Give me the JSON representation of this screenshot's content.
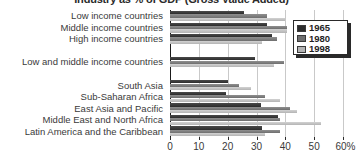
{
  "chart_data": {
    "type": "bar",
    "orientation": "horizontal",
    "title": "Industry as % of GDP (Gross Value Added)",
    "xlabel": "",
    "ylabel": "",
    "xlim": [
      0,
      60
    ],
    "xticks": [
      0,
      10,
      20,
      30,
      40,
      50,
      60
    ],
    "xtick_labels": [
      "0",
      "10",
      "20",
      "30",
      "40",
      "50",
      "60%"
    ],
    "grid": true,
    "grid_axis": "x",
    "legend_position": "upper right",
    "categories": [
      "Low income countries",
      "Middle income countries",
      "High income countries",
      "Low and middle income countries",
      "South Asia",
      "Sub-Saharan Africa",
      "East Asia and Pacific",
      "Middle East and North Africa",
      "Latin America and the Caribbean"
    ],
    "group_breaks": [
      3,
      4
    ],
    "series": [
      {
        "name": "1965",
        "color": "#2c2c2c",
        "values": [
          25.5,
          33.5,
          35.5,
          29.5,
          20.0,
          19.5,
          31.5,
          37.5,
          32.0
        ]
      },
      {
        "name": "1980",
        "color": "#6e6e6e",
        "values": [
          33.5,
          40.5,
          37.0,
          39.5,
          24.0,
          33.0,
          41.5,
          38.0,
          38.0
        ]
      },
      {
        "name": "1998",
        "color": "#b4b4b4",
        "values": [
          40.0,
          40.5,
          32.0,
          36.0,
          28.0,
          38.0,
          44.0,
          52.5,
          33.0
        ]
      }
    ]
  },
  "legend": {
    "items": [
      {
        "label": "1965",
        "color": "#2c2c2c"
      },
      {
        "label": "1980",
        "color": "#6e6e6e"
      },
      {
        "label": "1998",
        "color": "#b4b4b4"
      }
    ]
  }
}
